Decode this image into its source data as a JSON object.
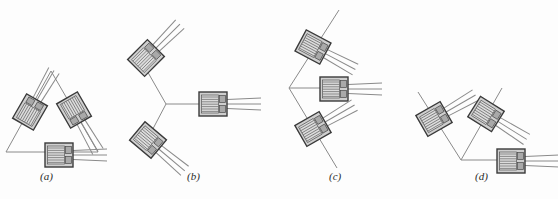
{
  "figure": {
    "background_color": "#fdfdfd",
    "panels": [
      {
        "id": "a",
        "label": "(a)",
        "label_x": 47,
        "label_y": 180,
        "type": "delta-rosette-triangle",
        "gauge_count": 3,
        "construction": "equilateral triangle outline",
        "gauges": [
          {
            "name": "gauge-left",
            "cx": 28,
            "cy": 112,
            "rotation": -60
          },
          {
            "name": "gauge-right",
            "cx": 75,
            "cy": 110,
            "rotation": 60
          },
          {
            "name": "gauge-bottom",
            "cx": 59,
            "cy": 155,
            "rotation": 0
          }
        ]
      },
      {
        "id": "b",
        "label": "(b)",
        "label_x": 194,
        "label_y": 180,
        "type": "delta-rosette-Y",
        "gauge_count": 3,
        "construction": "three-arm Y junction",
        "gauges": [
          {
            "name": "gauge-upper-left",
            "cx": 148,
            "cy": 60,
            "rotation": -45
          },
          {
            "name": "gauge-lower-left",
            "cx": 150,
            "cy": 140,
            "rotation": 40
          },
          {
            "name": "gauge-right",
            "cx": 213,
            "cy": 104,
            "rotation": 0
          }
        ]
      },
      {
        "id": "c",
        "label": "(c)",
        "label_x": 336,
        "label_y": 180,
        "type": "delta-rosette-vertex",
        "gauge_count": 3,
        "construction": "common vertex with two diagonals and one horizontal",
        "gauges": [
          {
            "name": "gauge-upper",
            "cx": 314,
            "cy": 48,
            "rotation": 26
          },
          {
            "name": "gauge-right",
            "cx": 333,
            "cy": 89,
            "rotation": 0
          },
          {
            "name": "gauge-lower",
            "cx": 314,
            "cy": 128,
            "rotation": -28
          }
        ]
      },
      {
        "id": "d",
        "label": "(d)",
        "label_x": 482,
        "label_y": 180,
        "type": "rectangular-rosette-vertex",
        "gauge_count": 3,
        "construction": "V junction with one horizontal arm",
        "gauges": [
          {
            "name": "gauge-left",
            "cx": 435,
            "cy": 118,
            "rotation": -28
          },
          {
            "name": "gauge-right",
            "cx": 487,
            "cy": 114,
            "rotation": 32
          },
          {
            "name": "gauge-low",
            "cx": 512,
            "cy": 161,
            "rotation": 0
          }
        ]
      }
    ],
    "gauge_style": {
      "body_fill": "#c9c9c9",
      "body_stroke": "#3a3a3a",
      "grid_line_color": "#6e6e6e",
      "tab_fill": "#b0b0b0",
      "lead_color": "#7a7a7a",
      "body_width": 28,
      "body_height": 24
    },
    "construction_line_color": "#8a8a8a",
    "construction_line_width": 1
  }
}
